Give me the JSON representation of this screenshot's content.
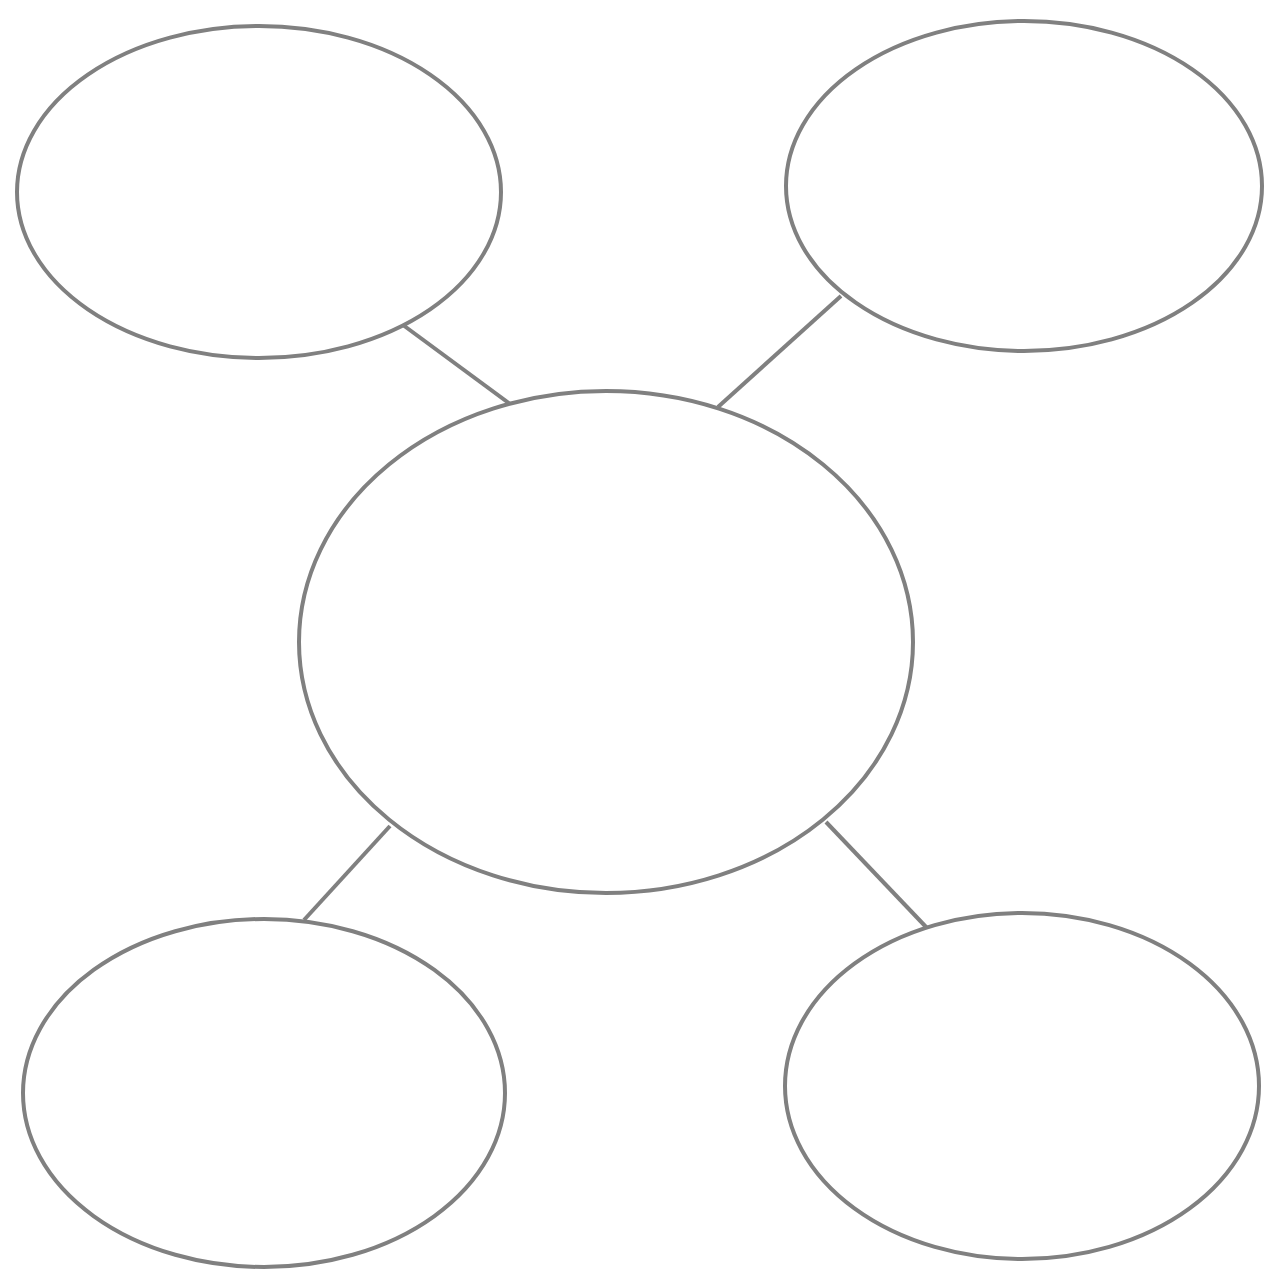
{
  "diagram": {
    "type": "bubble-map",
    "stroke_color": "#808080",
    "fill_color": "#ffffff",
    "stroke_width": 4,
    "nodes": [
      {
        "id": "center",
        "label": "",
        "cx": 606,
        "cy": 642,
        "rx": 307,
        "ry": 251
      },
      {
        "id": "top-left",
        "label": "",
        "cx": 259,
        "cy": 192,
        "rx": 242,
        "ry": 166
      },
      {
        "id": "top-right",
        "label": "",
        "cx": 1024,
        "cy": 186,
        "rx": 238,
        "ry": 165
      },
      {
        "id": "bottom-left",
        "label": "",
        "cx": 264,
        "cy": 1093,
        "rx": 241,
        "ry": 174
      },
      {
        "id": "bottom-right",
        "label": "",
        "cx": 1022,
        "cy": 1086,
        "rx": 237,
        "ry": 173
      }
    ],
    "edges": [
      {
        "from": "center",
        "to": "top-left",
        "x1": 510,
        "y1": 404,
        "x2": 403,
        "y2": 325
      },
      {
        "from": "center",
        "to": "top-right",
        "x1": 718,
        "y1": 407,
        "x2": 841,
        "y2": 296
      },
      {
        "from": "center",
        "to": "bottom-left",
        "x1": 390,
        "y1": 826,
        "x2": 304,
        "y2": 920
      },
      {
        "from": "center",
        "to": "bottom-right",
        "x1": 826,
        "y1": 822,
        "x2": 927,
        "y2": 928
      }
    ]
  }
}
